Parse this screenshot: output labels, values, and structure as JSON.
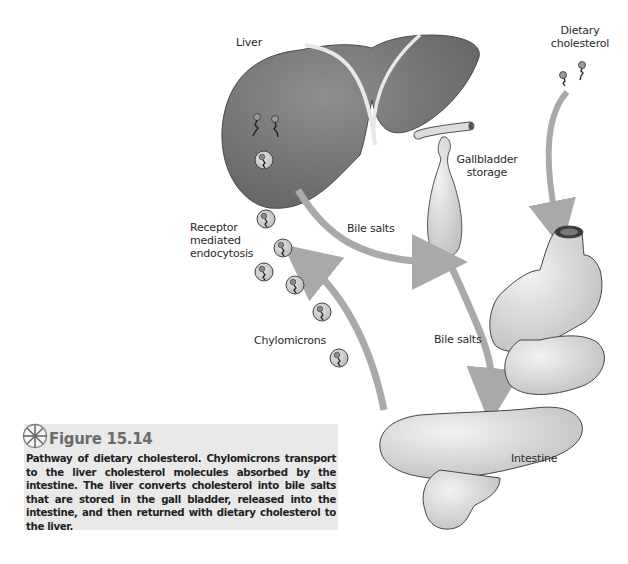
{
  "diagram": {
    "labels": {
      "liver": "Liver",
      "dietary_cholesterol_line1": "Dietary",
      "dietary_cholesterol_line2": "cholesterol",
      "gallbladder_line1": "Gallbladder",
      "gallbladder_line2": "storage",
      "receptor_line1": "Receptor",
      "receptor_line2": "mediated",
      "receptor_line3": "endocytosis",
      "bile_salts_upper": "Bile salts",
      "bile_salts_lower": "Bile salts",
      "chylomicrons": "Chylomicrons",
      "intestine": "Intestine"
    },
    "nodes": [
      "Liver",
      "Gallbladder storage",
      "Intestine",
      "Dietary cholesterol",
      "Chylomicrons"
    ],
    "edges": [
      {
        "from": "Liver",
        "to": "Gallbladder storage",
        "label": "Bile salts"
      },
      {
        "from": "Gallbladder storage",
        "to": "Intestine",
        "label": "Bile salts"
      },
      {
        "from": "Dietary cholesterol",
        "to": "Intestine",
        "label": ""
      },
      {
        "from": "Intestine",
        "to": "Liver",
        "label": "Chylomicrons (Receptor mediated endocytosis)"
      }
    ],
    "colors": {
      "liver": "#7a7a7a",
      "organ_light": "#d6d6d6",
      "arrow": "#a9a9a9",
      "caption_bg": "#e9e9e9",
      "figure_title": "#6b6b6b"
    }
  },
  "caption": {
    "figure_label": "Figure 15.14",
    "text": "Pathway of dietary cholesterol. Chylomicrons transport to the liver cholesterol molecules absorbed by the intestine. The liver converts cholesterol into bile salts that are stored in the gall bladder, released into the intestine, and then returned with dietary cholesterol to the liver."
  }
}
